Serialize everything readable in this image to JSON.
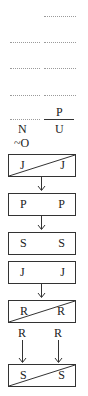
{
  "blank_rows": [
    {
      "y": 16,
      "left": false,
      "right": true
    },
    {
      "y": 42,
      "left": true,
      "right": true
    },
    {
      "y": 68,
      "left": true,
      "right": true
    },
    {
      "y": 95,
      "left": true,
      "right": true
    }
  ],
  "fraction_row": {
    "numerator_right": "P",
    "denominator_left": "N",
    "denominator_right": "U",
    "extra_label": "~O"
  },
  "boxes": [
    {
      "left": "J",
      "right": "J",
      "diagonal": true
    },
    {
      "left": "P",
      "right": "P",
      "diagonal": false
    },
    {
      "left": "S",
      "right": "S",
      "diagonal": false
    },
    {
      "left": "J",
      "right": "J",
      "diagonal": false
    },
    {
      "left": "R",
      "right": "R",
      "diagonal": true
    },
    {
      "left": "S",
      "right": "S",
      "diagonal": true
    }
  ],
  "between_labels": {
    "left": "R",
    "right": "R"
  },
  "colors": {
    "line": "#333333",
    "dots": "#9a9a9a",
    "background": "#ffffff"
  }
}
